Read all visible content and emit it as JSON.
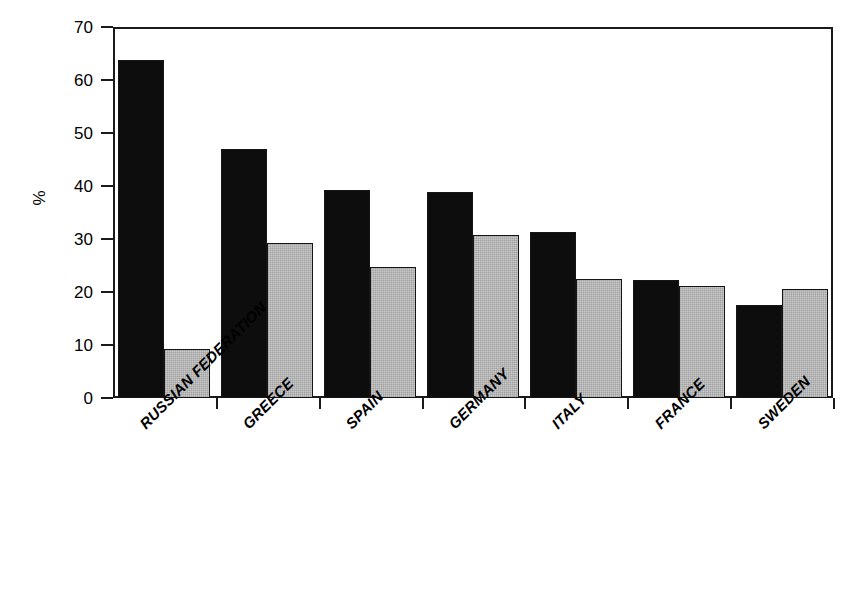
{
  "chart_data": {
    "type": "bar",
    "title": "",
    "xlabel": "",
    "ylabel": "%",
    "ylim": [
      0,
      70
    ],
    "yticks": [
      0,
      10,
      20,
      30,
      40,
      50,
      60,
      70
    ],
    "grid": false,
    "legend": "none",
    "categories": [
      "RUSSIAN FEDERATION",
      "GREECE",
      "SPAIN",
      "GERMANY",
      "ITALY",
      "FRANCE",
      "SWEDEN"
    ],
    "series": [
      {
        "name": "series-a",
        "color": "#0d0d0d",
        "values": [
          63.8,
          47.0,
          39.2,
          38.9,
          31.3,
          22.2,
          17.5
        ]
      },
      {
        "name": "series-b",
        "color": "#c9c9c9",
        "values": [
          9.3,
          29.2,
          24.8,
          30.8,
          22.4,
          21.1,
          20.6
        ]
      }
    ]
  },
  "axis": {
    "y_label_text": "%",
    "y_tick_labels": [
      "0",
      "10",
      "20",
      "30",
      "40",
      "50",
      "60",
      "70"
    ]
  },
  "colors": {
    "series_a": "#0d0d0d",
    "series_b": "#c9c9c9",
    "axis": "#1a1a1a",
    "background": "#ffffff"
  }
}
